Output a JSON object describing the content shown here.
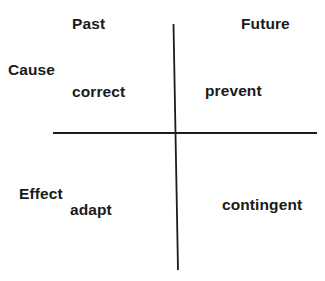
{
  "diagram": {
    "type": "quadrant",
    "columns": {
      "left": "Past",
      "right": "Future"
    },
    "rows": {
      "top": "Cause",
      "bottom": "Effect"
    },
    "quadrants": {
      "cause_past": "correct",
      "cause_future": "prevent",
      "effect_past": "adapt",
      "effect_future": "contingent"
    },
    "colors": {
      "text": "#1a1a1a",
      "lines": "#1c1c1c",
      "background": "#ffffff"
    }
  }
}
